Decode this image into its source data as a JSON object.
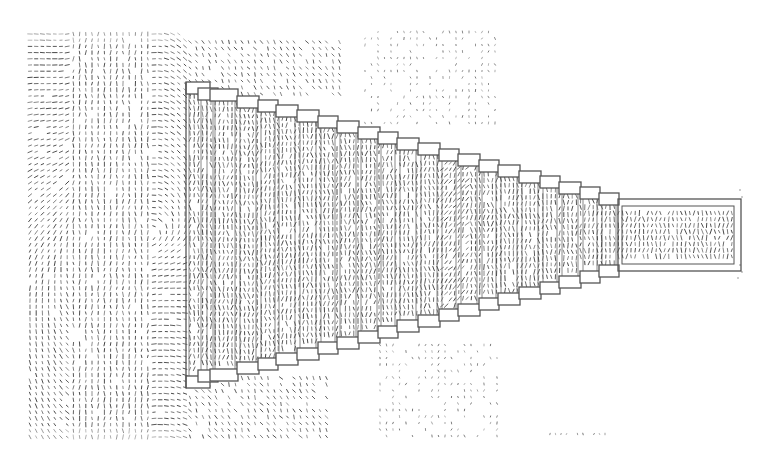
{
  "figure": {
    "background": "#ffffff",
    "arrow_color": "#3a3a3a",
    "outline_color": "#555555",
    "width": 769,
    "height": 470
  },
  "field_regions": [
    {
      "name": "left-field",
      "x0": 30,
      "x1": 190,
      "y0": 34,
      "y1": 440,
      "spacing": 6.2,
      "density": 0.95,
      "style": "swirl"
    },
    {
      "name": "upper-mid-field",
      "x0": 190,
      "x1": 345,
      "y0": 42,
      "y1": 95,
      "spacing": 6.5,
      "density": 0.85,
      "style": "flow"
    },
    {
      "name": "upper-right-cloud",
      "x0": 365,
      "x1": 495,
      "y0": 32,
      "y1": 125,
      "spacing": 6.5,
      "density": 0.55,
      "style": "sparse"
    },
    {
      "name": "lower-mid-field",
      "x0": 190,
      "x1": 330,
      "y0": 378,
      "y1": 440,
      "spacing": 6.5,
      "density": 0.85,
      "style": "flow"
    },
    {
      "name": "lower-right-cloud",
      "x0": 380,
      "x1": 500,
      "y0": 345,
      "y1": 440,
      "spacing": 6.5,
      "density": 0.55,
      "style": "sparse"
    },
    {
      "name": "bottom-strip",
      "x0": 550,
      "x1": 605,
      "y0": 434,
      "y1": 438,
      "spacing": 5.5,
      "density": 0.9,
      "style": "sparse"
    }
  ],
  "structure": {
    "top_steps": [
      {
        "x": 186,
        "y": 82,
        "w": 24
      },
      {
        "x": 198,
        "y": 88,
        "w": 20
      },
      {
        "x": 210,
        "y": 89,
        "w": 28
      },
      {
        "x": 237,
        "y": 96,
        "w": 22
      },
      {
        "x": 258,
        "y": 100,
        "w": 20
      },
      {
        "x": 276,
        "y": 105,
        "w": 22
      },
      {
        "x": 297,
        "y": 110,
        "w": 22
      },
      {
        "x": 318,
        "y": 116,
        "w": 20
      },
      {
        "x": 337,
        "y": 121,
        "w": 22
      },
      {
        "x": 358,
        "y": 127,
        "w": 22
      },
      {
        "x": 378,
        "y": 132,
        "w": 20
      },
      {
        "x": 397,
        "y": 138,
        "w": 22
      },
      {
        "x": 418,
        "y": 143,
        "w": 22
      },
      {
        "x": 439,
        "y": 149,
        "w": 20
      },
      {
        "x": 458,
        "y": 154,
        "w": 22
      },
      {
        "x": 479,
        "y": 160,
        "w": 20
      },
      {
        "x": 498,
        "y": 165,
        "w": 22
      },
      {
        "x": 519,
        "y": 171,
        "w": 22
      },
      {
        "x": 540,
        "y": 176,
        "w": 20
      },
      {
        "x": 559,
        "y": 182,
        "w": 22
      },
      {
        "x": 580,
        "y": 187,
        "w": 20
      },
      {
        "x": 599,
        "y": 193,
        "w": 20
      }
    ],
    "step_height": 12,
    "center_y": 235,
    "tip_box": {
      "x": 618,
      "y": 199,
      "w": 123,
      "h": 72,
      "inner_inset": 4
    },
    "column_density": 1.0
  },
  "inner_field": {
    "spacing_x": 4.2,
    "spacing_y": 6.2,
    "density": 0.92
  }
}
